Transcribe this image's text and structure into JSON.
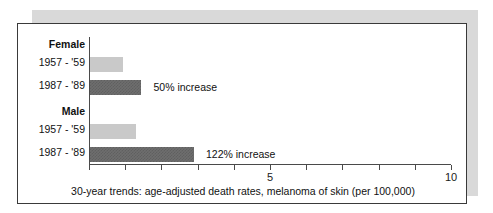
{
  "chart_data": {
    "type": "bar",
    "title": "",
    "caption": "30-year trends: age-adjusted death rates, melanoma of skin (per 100,000)",
    "orientation": "horizontal",
    "xlabel": "",
    "ylabel": "",
    "xlim": [
      0,
      10
    ],
    "grid": false,
    "legend": "none",
    "tick_values": [
      0,
      1,
      2,
      3,
      4,
      5,
      6,
      7,
      8,
      9,
      10
    ],
    "tick_labels": [
      "",
      "",
      "",
      "",
      "",
      "5",
      "",
      "",
      "",
      "",
      "10"
    ],
    "groups": [
      {
        "name": "Female",
        "bars": [
          {
            "category": "1957 - '59",
            "value": 0.95,
            "style": "light",
            "note": ""
          },
          {
            "category": "1987 - '89",
            "value": 1.45,
            "style": "dark",
            "note": "50% increase"
          }
        ]
      },
      {
        "name": "Male",
        "bars": [
          {
            "category": "1957 - '59",
            "value": 1.3,
            "style": "light",
            "note": ""
          },
          {
            "category": "1987 - '89",
            "value": 2.9,
            "style": "dark",
            "note": "122% increase"
          }
        ]
      }
    ],
    "colors": {
      "bar_light": "#c9c9c9",
      "bar_dark": "#6e6e6e",
      "axis": "#4a4a4a",
      "panel_border": "#3a3a3a",
      "shadow": "#d9d9d9",
      "background": "#ffffff",
      "text": "#111111"
    }
  }
}
